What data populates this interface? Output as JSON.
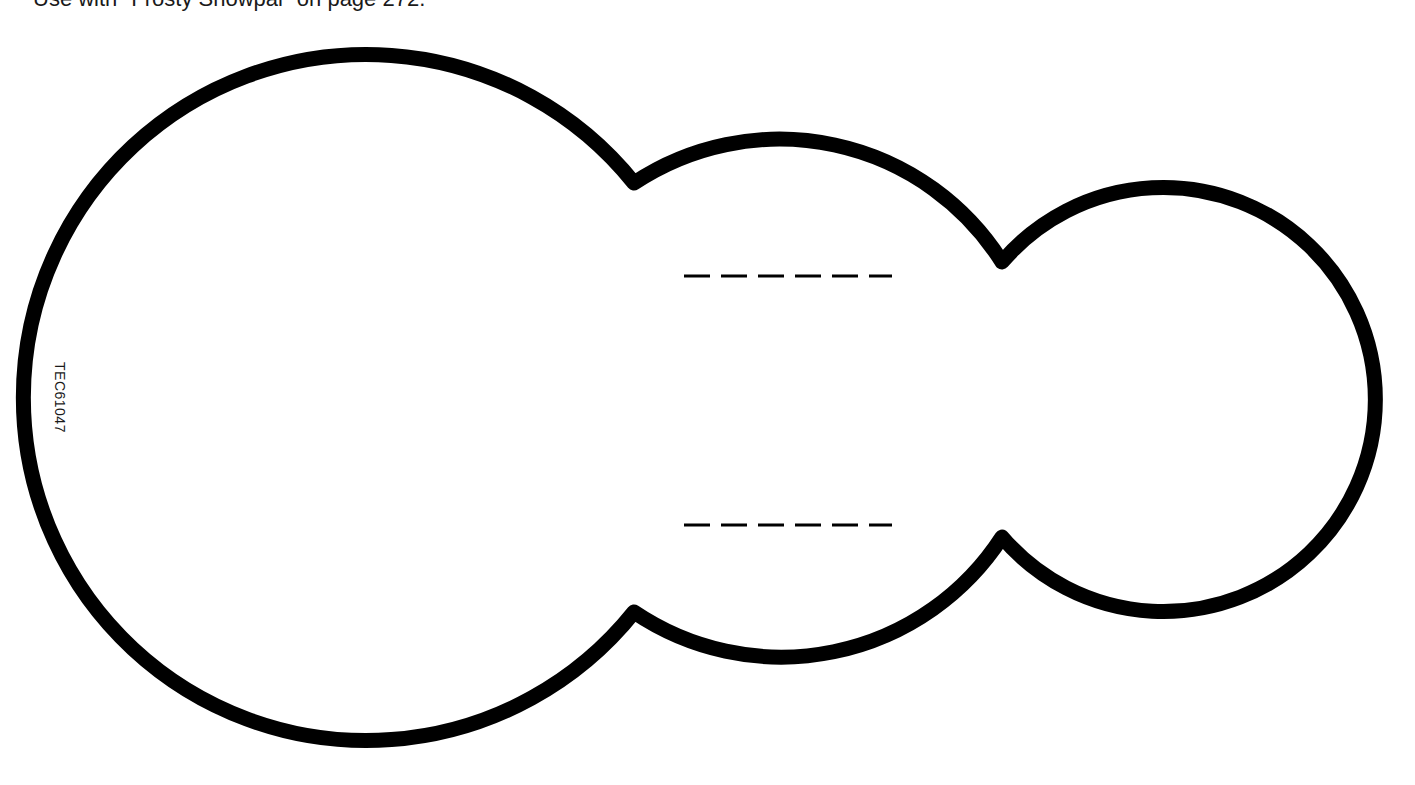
{
  "page": {
    "caption": "Use with \"Frosty Snowpal\" on page 272.",
    "code": "TEC61047"
  },
  "pattern": {
    "name": "snowman-body-outline",
    "stroke_color": "#000000",
    "stroke_width": 15,
    "fill_color": "#ffffff",
    "circles": [
      {
        "name": "large",
        "cx": 378,
        "cy": 397,
        "r": 343
      },
      {
        "name": "middle",
        "cx": 795,
        "cy": 397,
        "r": 263
      },
      {
        "name": "small",
        "cx": 1160,
        "cy": 398,
        "r": 212
      }
    ],
    "fold_lines": [
      {
        "name": "upper-fold-line",
        "x1": 684,
        "x2": 892,
        "y": 276,
        "dash_count": 6
      },
      {
        "name": "lower-fold-line",
        "x1": 684,
        "x2": 892,
        "y": 525,
        "dash_count": 6
      }
    ]
  }
}
